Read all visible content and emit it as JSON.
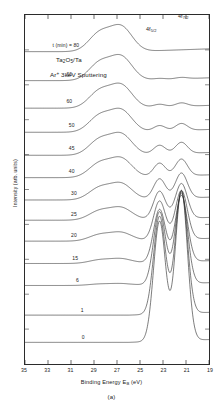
{
  "figure": {
    "panel_caption": "(a)",
    "annotations": {
      "sample_prefix": "Ta",
      "sample_sub1": "2",
      "sample_mid": "O",
      "sample_sub2": "5",
      "sample_suffix": "/Ta",
      "condition_prefix": "Ar",
      "condition_sup": "+",
      "condition_suffix": " 3keV Sputtering"
    },
    "peak_labels": [
      {
        "name": "4f-5/2",
        "base": "4f",
        "sub": "5/2",
        "x_ev": 23.2
      },
      {
        "name": "4f-7/2",
        "base": "4f",
        "sub": "7/2",
        "x_ev": 21.3
      }
    ]
  },
  "axes": {
    "x": {
      "label_main": "Binding Energy E",
      "label_sub": "B",
      "label_unit": " (eV)",
      "ticks": [
        35,
        33,
        31,
        29,
        27,
        25,
        23,
        21,
        19
      ],
      "min": 35,
      "max": 19,
      "inverted": true
    },
    "y": {
      "label": "Intensity (arb. units)",
      "ticks": []
    }
  },
  "chart_data": {
    "type": "line",
    "title": "Ta2O5/Ta  Ar+ 3keV Sputtering",
    "xlabel": "Binding Energy EB (eV)",
    "ylabel": "Intensity (arb. units)",
    "xlim": [
      35,
      19
    ],
    "ylim": [
      0,
      1
    ],
    "grid": false,
    "legend": "none",
    "x_inverted": true,
    "series_variable": "sputtering time t (min)",
    "series_labels": [
      "t (min) = 80",
      "66",
      "60",
      "50",
      "45",
      "40",
      "30",
      "25",
      "20",
      "15",
      "6",
      "1",
      "0"
    ],
    "series": [
      {
        "name": "t = 80",
        "label": "t (min) = 80",
        "time_min": 80,
        "baseline": 0.895,
        "oxide_amp": 0.052,
        "metal_amp": 0.0
      },
      {
        "name": "t = 66",
        "label": "66",
        "time_min": 66,
        "baseline": 0.812,
        "oxide_amp": 0.05,
        "metal_amp": 0.004
      },
      {
        "name": "t = 60",
        "label": "60",
        "time_min": 60,
        "baseline": 0.733,
        "oxide_amp": 0.048,
        "metal_amp": 0.01
      },
      {
        "name": "t = 50",
        "label": "50",
        "time_min": 50,
        "baseline": 0.664,
        "oxide_amp": 0.046,
        "metal_amp": 0.02
      },
      {
        "name": "t = 45",
        "label": "45",
        "time_min": 45,
        "baseline": 0.598,
        "oxide_amp": 0.044,
        "metal_amp": 0.032
      },
      {
        "name": "t = 40",
        "label": "40",
        "time_min": 40,
        "baseline": 0.534,
        "oxide_amp": 0.04,
        "metal_amp": 0.048
      },
      {
        "name": "t = 30",
        "label": "30",
        "time_min": 30,
        "baseline": 0.47,
        "oxide_amp": 0.034,
        "metal_amp": 0.072
      },
      {
        "name": "t = 25",
        "label": "25",
        "time_min": 25,
        "baseline": 0.412,
        "oxide_amp": 0.026,
        "metal_amp": 0.1
      },
      {
        "name": "t = 20",
        "label": "20",
        "time_min": 20,
        "baseline": 0.352,
        "oxide_amp": 0.018,
        "metal_amp": 0.14
      },
      {
        "name": "t = 15",
        "label": "15",
        "time_min": 15,
        "baseline": 0.288,
        "oxide_amp": 0.01,
        "metal_amp": 0.19
      },
      {
        "name": "t = 6",
        "label": "6",
        "time_min": 6,
        "baseline": 0.225,
        "oxide_amp": 0.004,
        "metal_amp": 0.26
      },
      {
        "name": "t = 1",
        "label": "1",
        "time_min": 1,
        "baseline": 0.14,
        "oxide_amp": 0.0,
        "metal_amp": 0.35
      },
      {
        "name": "t = 0",
        "label": "0",
        "time_min": 0,
        "baseline": 0.062,
        "oxide_amp": 0.0,
        "metal_amp": 0.43
      }
    ],
    "peaks": {
      "oxide_4f_5_2_ev": 28.5,
      "oxide_4f_7_2_ev": 26.6,
      "metal_4f_5_2_ev": 23.3,
      "metal_4f_7_2_ev": 21.4
    }
  },
  "series_label_positions": [
    {
      "cx_ev": 31.4,
      "name": "t (min) = 80"
    },
    {
      "cx_ev": 31.1,
      "name": "66"
    },
    {
      "cx_ev": 31.1,
      "name": "60"
    },
    {
      "cx_ev": 30.9,
      "name": "50"
    },
    {
      "cx_ev": 30.9,
      "name": "45"
    },
    {
      "cx_ev": 30.9,
      "name": "40"
    },
    {
      "cx_ev": 30.7,
      "name": "30"
    },
    {
      "cx_ev": 30.7,
      "name": "25"
    },
    {
      "cx_ev": 30.7,
      "name": "20"
    },
    {
      "cx_ev": 30.6,
      "name": "15"
    },
    {
      "cx_ev": 30.4,
      "name": "6"
    },
    {
      "cx_ev": 30.0,
      "name": "1"
    },
    {
      "cx_ev": 29.9,
      "name": "0"
    }
  ]
}
